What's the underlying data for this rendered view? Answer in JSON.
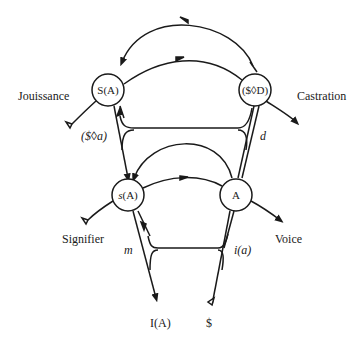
{
  "diagram": {
    "nodes": {
      "upper_left": {
        "label": "S(A)"
      },
      "upper_right": {
        "label": "($◊D)"
      },
      "lower_left": {
        "label": "s(A)"
      },
      "lower_right": {
        "label": "A"
      }
    },
    "labels": {
      "jouissance": "Jouissance",
      "castration": "Castration",
      "fantasy": "($◊a)",
      "desire": "d",
      "signifier": "Signifier",
      "voice": "Voice",
      "ego": "m",
      "image": "i(a)",
      "ideal": "I(A)",
      "subject": "$"
    },
    "colors": {
      "stroke": "#1a1a1a",
      "background": "#ffffff"
    }
  }
}
